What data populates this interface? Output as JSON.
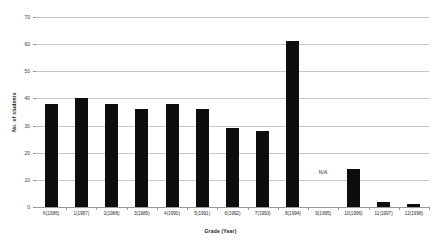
{
  "chart_data": {
    "type": "bar",
    "title": "",
    "xlabel": "Grade (Year)",
    "ylabel": "No. of students",
    "categories": [
      "K(1986)",
      "1(1987)",
      "2(1988)",
      "3(1989)",
      "4(1990)",
      "5(1991)",
      "6(1992)",
      "7(1993)",
      "8(1994)",
      "9(1995)",
      "10(1996)",
      "11(1997)",
      "12(1998)"
    ],
    "values": [
      38,
      40,
      38,
      36,
      38,
      36,
      29,
      28,
      61,
      null,
      14,
      2,
      1
    ],
    "ylim": [
      0,
      70
    ],
    "ytick_values": [
      0,
      10,
      20,
      30,
      40,
      50,
      60,
      70
    ],
    "ytick_labels": [
      "0",
      "10",
      "20",
      "30",
      "40",
      "50",
      "60",
      "70"
    ],
    "grid": true,
    "legend": "none",
    "bar_color": "#0d0d0d",
    "grid_color": "#c8c8c8",
    "axis_color": "#9a9a9a",
    "background_color": "#ffffff",
    "annotations": [
      {
        "text": "N/A",
        "category": "9(1995)",
        "value": 13
      }
    ]
  }
}
